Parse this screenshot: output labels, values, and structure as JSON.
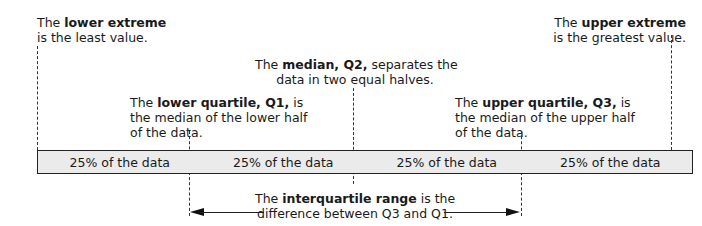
{
  "annotations": {
    "lower_extreme": {
      "prefix": "The ",
      "bold": "lower extreme",
      "line2": "is the least value."
    },
    "upper_extreme": {
      "prefix": "The ",
      "bold": "upper extreme",
      "line2": "is the greatest value."
    },
    "median": {
      "prefix": "The ",
      "bold": "median, Q2,",
      "suffix": " separates the",
      "line2": "data in two equal halves."
    },
    "lower_quartile": {
      "prefix": "The ",
      "bold": "lower quartile, Q1,",
      "suffix": " is",
      "line2": "the median of the lower half",
      "line3": "of the data."
    },
    "upper_quartile": {
      "prefix": "The ",
      "bold": "upper quartile, Q3,",
      "suffix": " is",
      "line2": "the median of the upper half",
      "line3": "of the data."
    },
    "iqr": {
      "prefix": "The ",
      "bold": "interquartile range",
      "suffix": " is the",
      "line2": "difference between Q3 and Q1."
    }
  },
  "bar": {
    "segments": [
      "25% of the data",
      "25% of the data",
      "25% of the data",
      "25% of the data"
    ]
  },
  "colors": {
    "bar_fill": "#ebebeb",
    "stroke": "#222222"
  }
}
